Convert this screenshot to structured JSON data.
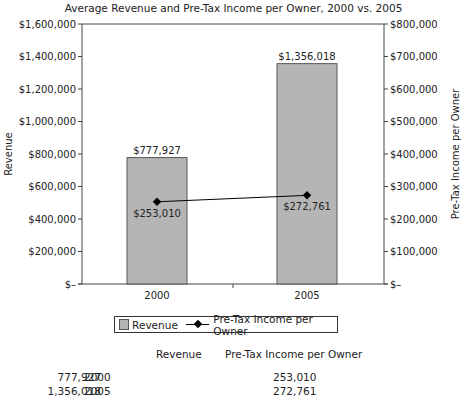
{
  "chart_data": {
    "type": "bar+line",
    "title": "Average Revenue and Pre-Tax Income per Owner, 2000 vs. 2005",
    "categories": [
      "2000",
      "2005"
    ],
    "series": [
      {
        "name": "Revenue",
        "type": "bar",
        "axis": "left",
        "values": [
          777927,
          1356018
        ],
        "labels": [
          "$777,927",
          "$1,356,018"
        ],
        "color": "#b5b5b5"
      },
      {
        "name": "Pre-Tax Income per Owner",
        "type": "line",
        "axis": "right",
        "values": [
          253010,
          272761
        ],
        "labels": [
          "$253,010",
          "$272,761"
        ],
        "color": "#000000"
      }
    ],
    "ylabel": "Revenue",
    "y2label": "Pre-Tax Income per Owner",
    "ylim": [
      0,
      1600000
    ],
    "y2lim": [
      0,
      800000
    ],
    "yticks": [
      "$1,600,000",
      "$1,400,000",
      "$1,200,000",
      "$1,000,000",
      "$800,000",
      "$600,000",
      "$400,000",
      "$200,000",
      "$–"
    ],
    "y2ticks": [
      "$800,000",
      "$700,000",
      "$600,000",
      "$500,000",
      "$400,000",
      "$300,000",
      "$200,000",
      "$100,000",
      "$–"
    ],
    "legend_position": "bottom",
    "grid": false
  },
  "legend": {
    "bar_label": "Revenue",
    "line_label": "Pre-Tax Income per Owner"
  },
  "table": {
    "headers": [
      "",
      "Revenue",
      "Pre-Tax Income per Owner"
    ],
    "rows": [
      [
        "2000",
        "777,927",
        "253,010"
      ],
      [
        "2005",
        "1,356,018",
        "272,761"
      ]
    ]
  }
}
